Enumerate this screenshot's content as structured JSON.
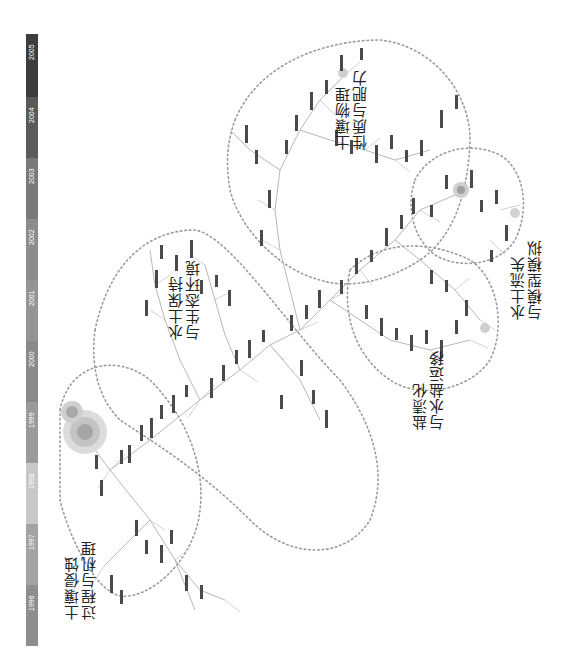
{
  "figure": {
    "type": "co-word knowledge map (time-zone network, rotated 90°)",
    "orientation": "rotated counter-clockwise"
  },
  "timeline": {
    "years": [
      {
        "label": "1996",
        "color": "#3d3d3d"
      },
      {
        "label": "1997",
        "color": "#5a5a5a"
      },
      {
        "label": "1998",
        "color": "#7a7a7a"
      },
      {
        "label": "1999",
        "color": "#8c8c8c"
      },
      {
        "label": "2000",
        "color": "#949494"
      },
      {
        "label": "2001",
        "color": "#8a8a8a"
      },
      {
        "label": "2002",
        "color": "#9a9a9a"
      },
      {
        "label": "2003",
        "color": "#c8c8c8"
      },
      {
        "label": "2004",
        "color": "#a3a3a3"
      },
      {
        "label": "2005",
        "color": "#8e8e8e"
      }
    ]
  },
  "clusters": [
    {
      "id": "erosion",
      "line1": "土壤侵蚀",
      "line2": "过程与机理"
    },
    {
      "id": "conservation",
      "line1": "水土保持",
      "line2": "与生态环境"
    },
    {
      "id": "physics",
      "line1": "土壤物理",
      "line2": "性质与肥力"
    },
    {
      "id": "salinization",
      "line1": "盐渍化",
      "line2": "与水盐运移"
    },
    {
      "id": "loss",
      "line1": "水土流失",
      "line2": "与模型模拟"
    }
  ],
  "colors": {
    "outline": "#9a9a9a",
    "edge": "#b8b8b8",
    "node_text": "#333333",
    "hub_outer": "#bdbdbd",
    "hub_inner": "#8f8f8f"
  },
  "note": "Small node keyword labels are too fine to be legible and are drawn as generic node marks."
}
